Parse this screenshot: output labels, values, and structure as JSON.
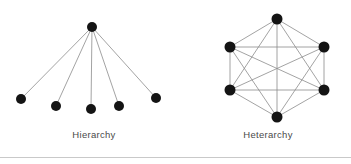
{
  "figure": {
    "background_color": "#ffffff",
    "node_color": "#141414",
    "edge_color": "#8c8c8c",
    "caption_color": "#4a4a4a",
    "divider_color": "#c9c9c9",
    "width": 351,
    "height": 164
  },
  "panels": [
    {
      "id": "hierarchy",
      "caption": "Hierarchy",
      "type": "tree",
      "node_radius": 5.0,
      "edge_width": 0.8,
      "nodes": [
        {
          "id": "root",
          "label": "root",
          "x": 92,
          "y": 27
        },
        {
          "id": "c1",
          "label": "child-1",
          "x": 21,
          "y": 99
        },
        {
          "id": "c2",
          "label": "child-2",
          "x": 56,
          "y": 106
        },
        {
          "id": "c3",
          "label": "child-3",
          "x": 91,
          "y": 109
        },
        {
          "id": "c4",
          "label": "child-4",
          "x": 119,
          "y": 106
        },
        {
          "id": "c5",
          "label": "child-5",
          "x": 156,
          "y": 98
        }
      ],
      "edges": [
        [
          "root",
          "c1"
        ],
        [
          "root",
          "c2"
        ],
        [
          "root",
          "c3"
        ],
        [
          "root",
          "c4"
        ],
        [
          "root",
          "c5"
        ]
      ]
    },
    {
      "id": "heterarchy",
      "caption": "Heterarchy",
      "type": "complete-graph",
      "node_radius": 5.5,
      "edge_width": 0.8,
      "nodes": [
        {
          "id": "n1",
          "label": "node-top",
          "x": 277,
          "y": 19
        },
        {
          "id": "n2",
          "label": "node-upper-right",
          "x": 324,
          "y": 47
        },
        {
          "id": "n3",
          "label": "node-lower-right",
          "x": 324,
          "y": 90
        },
        {
          "id": "n4",
          "label": "node-bottom",
          "x": 277,
          "y": 117
        },
        {
          "id": "n5",
          "label": "node-lower-left",
          "x": 230,
          "y": 90
        },
        {
          "id": "n6",
          "label": "node-upper-left",
          "x": 230,
          "y": 47
        }
      ],
      "edges": [
        [
          "n1",
          "n2"
        ],
        [
          "n1",
          "n3"
        ],
        [
          "n1",
          "n4"
        ],
        [
          "n1",
          "n5"
        ],
        [
          "n1",
          "n6"
        ],
        [
          "n2",
          "n3"
        ],
        [
          "n2",
          "n4"
        ],
        [
          "n2",
          "n5"
        ],
        [
          "n2",
          "n6"
        ],
        [
          "n3",
          "n4"
        ],
        [
          "n3",
          "n5"
        ],
        [
          "n3",
          "n6"
        ],
        [
          "n4",
          "n5"
        ],
        [
          "n4",
          "n6"
        ],
        [
          "n5",
          "n6"
        ]
      ]
    }
  ]
}
